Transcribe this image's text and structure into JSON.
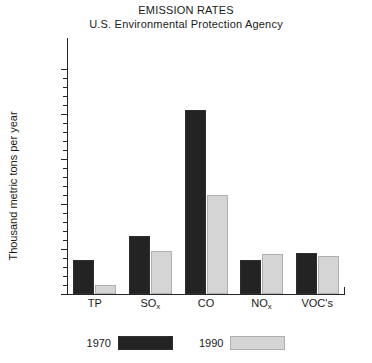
{
  "chart_data": {
    "type": "bar",
    "title": "EMISSION RATES",
    "subtitle": "U.S. Environmental Protection Agency",
    "xlabel": "",
    "ylabel": "Thousand metric tons per year",
    "categories": [
      "TP",
      "SOx",
      "CO",
      "NOx",
      "VOC's"
    ],
    "category_labels_html": [
      "TP",
      "SO<sub>x</sub>",
      "CO",
      "NO<sub>x</sub>",
      "VOC's"
    ],
    "series": [
      {
        "name": "1970",
        "color": "#232323",
        "values": [
          19,
          32,
          102,
          19,
          23
        ]
      },
      {
        "name": "1990",
        "color": "#d5d5d5",
        "values": [
          5,
          24,
          55,
          22,
          21
        ]
      }
    ],
    "ytick_labels": [
      "0",
      "25",
      "50",
      "75",
      "100",
      "250"
    ],
    "ytick_values": [
      0,
      25,
      50,
      75,
      100,
      250
    ],
    "minor_ticks_between": 4,
    "ylim": [
      0,
      125
    ],
    "grid": false,
    "legend_position": "bottom"
  },
  "legend": {
    "items": [
      {
        "label": "1970",
        "color": "#232323"
      },
      {
        "label": "1990",
        "color": "#d5d5d5"
      }
    ]
  },
  "colors": {
    "axis": "#262626",
    "background": "#ffffff",
    "series_1970": "#232323",
    "series_1990": "#d5d5d5"
  }
}
